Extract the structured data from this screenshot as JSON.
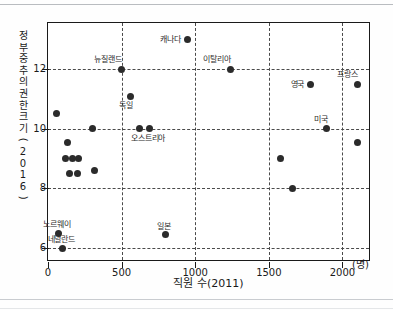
{
  "chart_data": {
    "type": "scatter",
    "title": "",
    "xlabel": "직원 수(2011)",
    "ylabel": "정부 중추의 권한 크기(2016)",
    "x_unit": "(명)",
    "xlim": [
      0,
      2180
    ],
    "ylim": [
      5.6,
      13.55
    ],
    "xticks": [
      0,
      500,
      1000,
      1500,
      2000
    ],
    "xtick_labels": [
      "0",
      "500",
      "1000",
      "1500",
      "2000"
    ],
    "yticks": [
      6,
      8,
      10,
      12
    ],
    "ytick_labels": [
      "6",
      "8",
      "10",
      "12"
    ],
    "grid": "dashed gridlines at x ticks 500/1000/1500/2000 and y ticks 6/8/10/12",
    "legend": "none",
    "points": [
      {
        "label": "",
        "x": 60,
        "y": 10.5
      },
      {
        "label": "",
        "x": 135,
        "y": 9.55
      },
      {
        "label": "",
        "x": 120,
        "y": 9.0
      },
      {
        "label": "",
        "x": 165,
        "y": 9.0
      },
      {
        "label": "",
        "x": 205,
        "y": 9.0
      },
      {
        "label": "",
        "x": 145,
        "y": 8.5
      },
      {
        "label": "",
        "x": 200,
        "y": 8.5
      },
      {
        "label": "",
        "x": 300,
        "y": 10.0
      },
      {
        "label": "",
        "x": 315,
        "y": 8.6
      },
      {
        "label": "노르웨이",
        "x": 72,
        "y": 6.5,
        "label_pos": "above"
      },
      {
        "label": "네덜란드",
        "x": 100,
        "y": 6.0,
        "label_pos": "above"
      },
      {
        "label": "뉴질랜드",
        "x": 500,
        "y": 12.0,
        "label_pos": "above-left"
      },
      {
        "label": "독일",
        "x": 560,
        "y": 11.1,
        "label_pos": "below-left"
      },
      {
        "label": "오스트리아",
        "x": 620,
        "y": 10.0,
        "label_pos": "below"
      },
      {
        "label": "",
        "x": 690,
        "y": 10.0
      },
      {
        "label": "일본",
        "x": 795,
        "y": 6.45,
        "label_pos": "above"
      },
      {
        "label": "캐나다",
        "x": 950,
        "y": 13.0,
        "label_pos": "left"
      },
      {
        "label": "이탈리아",
        "x": 1240,
        "y": 12.0,
        "label_pos": "above-left"
      },
      {
        "label": "",
        "x": 1580,
        "y": 9.0
      },
      {
        "label": "",
        "x": 1660,
        "y": 8.0
      },
      {
        "label": "영국",
        "x": 1785,
        "y": 11.5,
        "label_pos": "left"
      },
      {
        "label": "미국",
        "x": 1890,
        "y": 10.0,
        "label_pos": "above-left"
      },
      {
        "label": "프랑스",
        "x": 2100,
        "y": 11.5,
        "label_pos": "above-left"
      },
      {
        "label": "",
        "x": 2105,
        "y": 9.55
      }
    ]
  },
  "colors": {
    "dot": "#2b2b2b",
    "axis": "#1a1a1a",
    "grid": "#4a4a4a",
    "background": "#ffffff",
    "rule": "#b9bcc0"
  }
}
